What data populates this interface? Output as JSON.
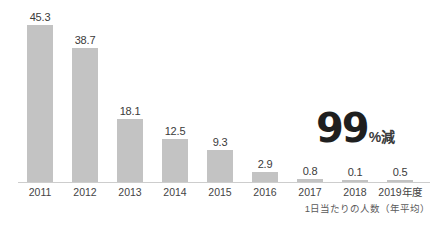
{
  "chart_data": {
    "type": "bar",
    "title": "",
    "subtitle": "",
    "xlabel": "",
    "ylabel": "",
    "categories": [
      "2011",
      "2012",
      "2013",
      "2014",
      "2015",
      "2016",
      "2017",
      "2018",
      "2019年度"
    ],
    "values": [
      45.3,
      38.7,
      18.1,
      12.5,
      9.3,
      2.9,
      0.8,
      0.1,
      0.5
    ],
    "value_labels": [
      "45.3",
      "38.7",
      "18.1",
      "12.5",
      "9.3",
      "2.9",
      "0.8",
      "0.1",
      "0.5"
    ],
    "ylim": [
      0,
      45.3
    ],
    "grid": false,
    "legend": null,
    "bar_color": "#c3c3c3",
    "axis_color": "#cdcdcd",
    "text_color": "#3b3b3b",
    "annotations": [
      {
        "name": "reduction-callout",
        "number": "99",
        "suffix": "%減"
      }
    ],
    "caption": "1日当たりの人数（年平均）"
  }
}
